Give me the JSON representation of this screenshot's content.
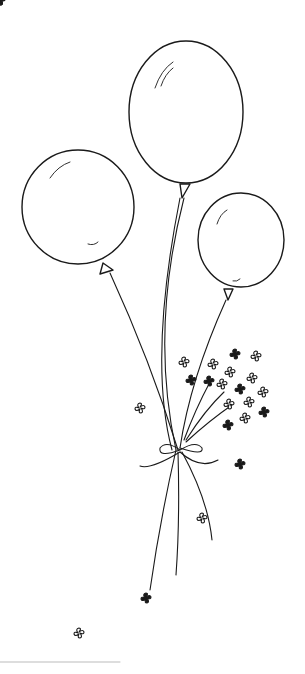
{
  "image": {
    "width": 305,
    "height": 674,
    "description": "Hand-drawn ink sketch of three balloons tied together with a bow, accompanied by small four-petal flowers",
    "colors": {
      "background": "#ffffff",
      "ink": "#1a1a1a"
    }
  },
  "balloons": [
    {
      "name": "left",
      "cx": 78,
      "cy": 208,
      "rx": 56,
      "ry": 57
    },
    {
      "name": "center",
      "cx": 186,
      "cy": 113,
      "rx": 57,
      "ry": 71
    },
    {
      "name": "right",
      "cx": 241,
      "cy": 241,
      "rx": 43,
      "ry": 47
    }
  ]
}
